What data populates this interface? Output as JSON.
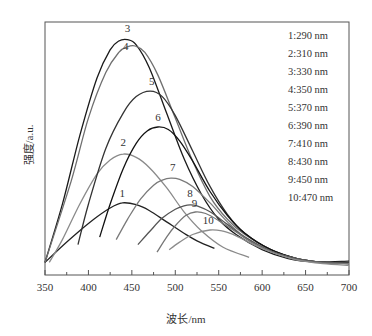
{
  "chart_data": {
    "type": "line",
    "title": "",
    "xlabel": "波长/nm",
    "ylabel": "强度/a.u.",
    "xlim": [
      350,
      700
    ],
    "ylim": [
      0,
      100
    ],
    "x_ticks": [
      350,
      400,
      450,
      500,
      550,
      600,
      650,
      700
    ],
    "y_ticks": [],
    "grid": false,
    "legend_position": "upper right (inside plot, text only)",
    "series": [
      {
        "name": "1:290 nm",
        "label": "1",
        "excitation_nm": 290,
        "color": "#222222",
        "x": [
          350,
          370,
          390,
          410,
          425,
          439,
          455,
          470,
          490,
          510,
          525,
          545
        ],
        "y": [
          5,
          11.5,
          17.5,
          23,
          26.5,
          28.5,
          27.8,
          25.5,
          21,
          16.5,
          13.5,
          10.5
        ]
      },
      {
        "name": "2:310 nm",
        "label": "2",
        "excitation_nm": 310,
        "color": "#8a8a8a",
        "x": [
          355,
          370,
          390,
          410,
          425,
          440,
          455,
          470,
          490,
          510,
          530,
          555,
          585
        ],
        "y": [
          5,
          14,
          28,
          40,
          45.5,
          47.8,
          46.5,
          42.5,
          34.5,
          25,
          17.5,
          11,
          7
        ]
      },
      {
        "name": "3:330 nm",
        "label": "3",
        "excitation_nm": 330,
        "color": "#1a1a1a",
        "x": [
          350,
          370,
          390,
          410,
          425,
          435,
          445,
          455,
          470,
          490,
          510,
          530,
          550,
          570,
          600,
          630,
          660,
          700
        ],
        "y": [
          5,
          28,
          55,
          78,
          89,
          92.5,
          93,
          91,
          82,
          64,
          46,
          32,
          22,
          16,
          10,
          6.5,
          5.2,
          5.5
        ]
      },
      {
        "name": "4:350 nm",
        "label": "4",
        "excitation_nm": 350,
        "color": "#6f6f6f",
        "x": [
          350,
          380,
          400,
          420,
          435,
          445,
          454,
          465,
          480,
          500,
          520,
          540,
          560,
          580,
          610,
          640,
          670,
          700
        ],
        "y": [
          5,
          37,
          62,
          80,
          88,
          90.2,
          90.5,
          88,
          79,
          62,
          45,
          31,
          22,
          16,
          10,
          6.5,
          5,
          5
        ]
      },
      {
        "name": "5:370 nm",
        "label": "5",
        "excitation_nm": 370,
        "color": "#333333",
        "x": [
          388,
          400,
          420,
          440,
          455,
          471,
          485,
          500,
          520,
          540,
          560,
          580,
          610,
          640,
          670,
          700
        ],
        "y": [
          12,
          28,
          50,
          64,
          70.5,
          72.7,
          70.5,
          63,
          49,
          35,
          24,
          16.5,
          10,
          6.5,
          5,
          4.8
        ]
      },
      {
        "name": "6:390 nm",
        "label": "6",
        "excitation_nm": 390,
        "color": "#111111",
        "x": [
          413,
          425,
          440,
          455,
          468,
          480,
          492,
          505,
          520,
          540,
          560,
          580,
          610,
          640,
          670,
          700
        ],
        "y": [
          15,
          28,
          42,
          52,
          57,
          58.5,
          57.5,
          53,
          45,
          33,
          23.5,
          16.5,
          10,
          6.5,
          5,
          4.5
        ]
      },
      {
        "name": "7:410 nm",
        "label": "7",
        "excitation_nm": 410,
        "color": "#7a7a7a",
        "x": [
          432,
          445,
          460,
          475,
          485,
          495,
          505,
          520,
          540,
          560,
          580,
          610,
          640,
          670,
          700
        ],
        "y": [
          14,
          22,
          30,
          35.5,
          37.5,
          38.3,
          37.8,
          35,
          28.5,
          21,
          15,
          9.5,
          6.5,
          5,
          4.5
        ]
      },
      {
        "name": "8:430 nm",
        "label": "8",
        "excitation_nm": 430,
        "color": "#555555",
        "x": [
          457,
          470,
          485,
          500,
          510,
          517,
          525,
          540,
          560,
          580,
          610,
          640,
          670,
          700
        ],
        "y": [
          12,
          17,
          22.5,
          26,
          27.3,
          27.7,
          27.3,
          25,
          20,
          15,
          9.5,
          6.5,
          5,
          4.5
        ]
      },
      {
        "name": "9:450 nm",
        "label": "9",
        "excitation_nm": 450,
        "color": "#777777",
        "x": [
          479,
          490,
          500,
          512,
          523,
          535,
          550,
          570,
          590,
          615,
          640,
          670,
          700
        ],
        "y": [
          9,
          15,
          19.5,
          23.5,
          24.9,
          24.3,
          21.5,
          17,
          12.5,
          8.5,
          6,
          4.8,
          4.5
        ]
      },
      {
        "name": "10:470 nm",
        "label": "10",
        "excitation_nm": 470,
        "color": "#8c8c8c",
        "x": [
          493,
          505,
          520,
          540,
          555,
          570,
          590,
          615,
          640,
          670,
          700
        ],
        "y": [
          10,
          13,
          16,
          17.8,
          17.3,
          15.5,
          12,
          8.5,
          6,
          4.5,
          3.8
        ]
      }
    ],
    "annotations": [
      {
        "text": "1",
        "x": 439,
        "y": 31
      },
      {
        "text": "2",
        "x": 440,
        "y": 51
      },
      {
        "text": "3",
        "x": 445,
        "y": 96
      },
      {
        "text": "4",
        "x": 443,
        "y": 89
      },
      {
        "text": "5",
        "x": 473,
        "y": 75
      },
      {
        "text": "6",
        "x": 480,
        "y": 61
      },
      {
        "text": "7",
        "x": 497,
        "y": 41
      },
      {
        "text": "8",
        "x": 517,
        "y": 31
      },
      {
        "text": "9",
        "x": 522,
        "y": 27
      },
      {
        "text": "10",
        "x": 538,
        "y": 20
      }
    ]
  },
  "axes": {
    "xlabel": "波长/nm",
    "ylabel": "强度/a.u."
  },
  "legend": {
    "items": [
      "1:290 nm",
      "2:310 nm",
      "3:330 nm",
      "4:350 nm",
      "5:370 nm",
      "6:390 nm",
      "7:410 nm",
      "8:430 nm",
      "9:450 nm",
      "10:470 nm"
    ]
  }
}
